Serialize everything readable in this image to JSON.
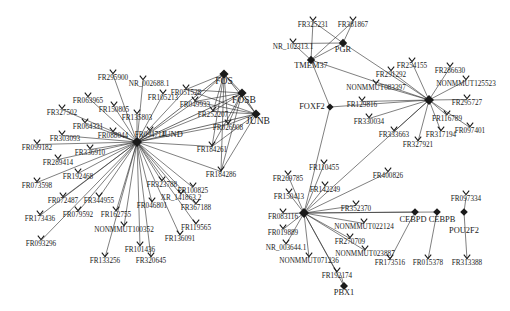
{
  "figure": {
    "type": "network-graph",
    "background": "#ffffff",
    "node_color": "#1a1a1a",
    "edge_color": "#2a2a2a",
    "hub_node_shape": "diamond",
    "leaf_node_shape": "arrowhead-v"
  },
  "hubs": [
    {
      "id": "FOS",
      "label": "FOS",
      "x": 224,
      "y": 74,
      "r": 4.6,
      "lx": 224,
      "ly": 76,
      "size": "hub"
    },
    {
      "id": "FOSB",
      "label": "FOSB",
      "x": 242,
      "y": 93,
      "r": 4.6,
      "lx": 244,
      "ly": 95,
      "size": "hub"
    },
    {
      "id": "JUNB",
      "label": "JUNB",
      "x": 256,
      "y": 114,
      "r": 4.6,
      "lx": 258,
      "ly": 116,
      "size": "hub"
    },
    {
      "id": "JUND",
      "label": "JUND",
      "x": 137,
      "y": 142,
      "r": 5.0,
      "lx": 172,
      "ly": 131,
      "size": "mid"
    },
    {
      "id": "PGR",
      "label": "PGR",
      "x": 343,
      "y": 43,
      "r": 4.2,
      "lx": 343,
      "ly": 46,
      "size": "mid"
    },
    {
      "id": "TMEM37",
      "label": "TMEM37",
      "x": 311,
      "y": 60,
      "r": 4.2,
      "lx": 311,
      "ly": 62,
      "size": "mid"
    },
    {
      "id": "FOXF2",
      "label": "FOXF2",
      "x": 330,
      "y": 107,
      "r": 3.6,
      "lx": 312,
      "ly": 103,
      "size": "mid"
    },
    {
      "id": "HUB_RIGHT",
      "label": "",
      "x": 429,
      "y": 100,
      "r": 5.0,
      "lx": 429,
      "ly": 103,
      "size": "mid"
    },
    {
      "id": "ONE",
      "label": "",
      "x": 304,
      "y": 213,
      "r": 5.0,
      "lx": 304,
      "ly": 216,
      "size": "mid"
    },
    {
      "id": "CEBPD",
      "label": "CEBPD",
      "x": 415,
      "y": 212,
      "r": 3.8,
      "lx": 413,
      "ly": 216,
      "size": "mid"
    },
    {
      "id": "CEBPB",
      "label": "CEBPB",
      "x": 437,
      "y": 212,
      "r": 3.8,
      "lx": 442,
      "ly": 216,
      "size": "mid"
    },
    {
      "id": "POU2F2",
      "label": "POU2F2",
      "x": 464,
      "y": 212,
      "r": 3.8,
      "lx": 464,
      "ly": 227,
      "size": "mid"
    },
    {
      "id": "PBX1",
      "label": "PBX1",
      "x": 344,
      "y": 286,
      "r": 4.0,
      "lx": 344,
      "ly": 289,
      "size": "mid"
    }
  ],
  "leaves": {
    "jund_fan": [
      {
        "label": "FR295900",
        "x": 113,
        "y": 73,
        "tx": 113,
        "ty": 75
      },
      {
        "label": "NR_002688.1",
        "x": 143,
        "y": 79,
        "tx": 149,
        "ty": 81
      },
      {
        "label": "FR063965",
        "x": 88,
        "y": 96,
        "tx": 88,
        "ty": 98
      },
      {
        "label": "FR150805",
        "x": 114,
        "y": 105,
        "tx": 114,
        "ty": 107
      },
      {
        "label": "FR105213",
        "x": 163,
        "y": 93,
        "tx": 163,
        "ty": 95
      },
      {
        "label": "FR135803",
        "x": 137,
        "y": 113,
        "tx": 137,
        "ty": 115
      },
      {
        "label": "FR327502",
        "x": 62,
        "y": 108,
        "tx": 62,
        "ty": 110
      },
      {
        "label": "FR064331",
        "x": 85,
        "y": 122,
        "tx": 88,
        "ty": 124
      },
      {
        "label": "FR303093",
        "x": 62,
        "y": 134,
        "tx": 65,
        "ty": 136
      },
      {
        "label": "FR088044",
        "x": 113,
        "y": 131,
        "tx": 113,
        "ty": 133
      },
      {
        "label": "FR094714",
        "x": 150,
        "y": 130,
        "tx": 150,
        "ty": 132
      },
      {
        "label": "FR099182",
        "x": 37,
        "y": 143,
        "tx": 37,
        "ty": 145
      },
      {
        "label": "FR336910",
        "x": 90,
        "y": 148,
        "tx": 90,
        "ty": 150
      },
      {
        "label": "FR289414",
        "x": 58,
        "y": 158,
        "tx": 58,
        "ty": 160
      },
      {
        "label": "FR192468",
        "x": 78,
        "y": 172,
        "tx": 78,
        "ty": 174
      },
      {
        "label": "FR073598",
        "x": 37,
        "y": 181,
        "tx": 37,
        "ty": 183
      },
      {
        "label": "FR072487",
        "x": 63,
        "y": 196,
        "tx": 63,
        "ty": 198
      },
      {
        "label": "FR344955",
        "x": 99,
        "y": 196,
        "tx": 99,
        "ty": 198
      },
      {
        "label": "FR173436",
        "x": 40,
        "y": 214,
        "tx": 40,
        "ty": 216
      },
      {
        "label": "FR079592",
        "x": 78,
        "y": 210,
        "tx": 78,
        "ty": 212
      },
      {
        "label": "FR162755",
        "x": 116,
        "y": 210,
        "tx": 116,
        "ty": 212
      },
      {
        "label": "FR046801",
        "x": 152,
        "y": 201,
        "tx": 152,
        "ty": 203
      },
      {
        "label": "NONMMUT100352",
        "x": 124,
        "y": 225,
        "tx": 124,
        "ty": 227
      },
      {
        "label": "FR093296",
        "x": 41,
        "y": 239,
        "tx": 41,
        "ty": 241
      },
      {
        "label": "FR101436",
        "x": 140,
        "y": 245,
        "tx": 140,
        "ty": 247
      },
      {
        "label": "FR133256",
        "x": 105,
        "y": 256,
        "tx": 105,
        "ty": 258
      },
      {
        "label": "FR320645",
        "x": 151,
        "y": 256,
        "tx": 151,
        "ty": 258
      },
      {
        "label": "FR136091",
        "x": 180,
        "y": 234,
        "tx": 180,
        "ty": 236
      },
      {
        "label": "FR119565",
        "x": 196,
        "y": 223,
        "tx": 196,
        "ty": 225
      },
      {
        "label": "XR_141863.2",
        "x": 181,
        "y": 193,
        "tx": 181,
        "ty": 195
      },
      {
        "label": "FR367188",
        "x": 196,
        "y": 203,
        "tx": 196,
        "ty": 205
      },
      {
        "label": "FR323788",
        "x": 162,
        "y": 180,
        "tx": 162,
        "ty": 182
      },
      {
        "label": "FR100825",
        "x": 193,
        "y": 186,
        "tx": 193,
        "ty": 188
      },
      {
        "label": "FR184261",
        "x": 212,
        "y": 145,
        "tx": 212,
        "ty": 147
      },
      {
        "label": "FR026908",
        "x": 228,
        "y": 123,
        "tx": 228,
        "ty": 125
      },
      {
        "label": "FR252207",
        "x": 213,
        "y": 110,
        "tx": 213,
        "ty": 112
      },
      {
        "label": "FR049933",
        "x": 195,
        "y": 100,
        "tx": 195,
        "ty": 102
      },
      {
        "label": "FR051528",
        "x": 186,
        "y": 88,
        "tx": 186,
        "ty": 90
      },
      {
        "label": "FR184286",
        "x": 221,
        "y": 170,
        "tx": 221,
        "ty": 172
      }
    ],
    "pgr_group": [
      {
        "label": "FR325231",
        "x": 313,
        "y": 20,
        "tx": 313,
        "ty": 22
      },
      {
        "label": "FR381867",
        "x": 353,
        "y": 20,
        "tx": 353,
        "ty": 22
      },
      {
        "label": "NR_102313.1",
        "x": 293,
        "y": 42,
        "tx": 293,
        "ty": 44
      }
    ],
    "right_hub_fan": [
      {
        "label": "FR254155",
        "x": 412,
        "y": 61,
        "tx": 412,
        "ty": 63
      },
      {
        "label": "FR286630",
        "x": 450,
        "y": 66,
        "tx": 450,
        "ty": 68
      },
      {
        "label": "FR291292",
        "x": 391,
        "y": 70,
        "tx": 391,
        "ty": 72
      },
      {
        "label": "NONMMUT125523",
        "x": 466,
        "y": 79,
        "tx": 466,
        "ty": 81
      },
      {
        "label": "NONMMUT083397",
        "x": 376,
        "y": 83,
        "tx": 376,
        "ty": 85
      },
      {
        "label": "FR129816",
        "x": 362,
        "y": 100,
        "tx": 362,
        "ty": 102
      },
      {
        "label": "FR295727",
        "x": 467,
        "y": 98,
        "tx": 467,
        "ty": 100
      },
      {
        "label": "FR116789",
        "x": 447,
        "y": 114,
        "tx": 447,
        "ty": 116
      },
      {
        "label": "FR097401",
        "x": 470,
        "y": 126,
        "tx": 470,
        "ty": 128
      },
      {
        "label": "FR317194",
        "x": 441,
        "y": 130,
        "tx": 441,
        "ty": 132
      },
      {
        "label": "FR333663",
        "x": 394,
        "y": 130,
        "tx": 394,
        "ty": 132
      },
      {
        "label": "FR327921",
        "x": 418,
        "y": 140,
        "tx": 418,
        "ty": 142
      },
      {
        "label": "FR330034",
        "x": 369,
        "y": 117,
        "tx": 369,
        "ty": 119
      }
    ],
    "one_fan": [
      {
        "label": "FR110455",
        "x": 324,
        "y": 163,
        "tx": 324,
        "ty": 165
      },
      {
        "label": "FR269785",
        "x": 288,
        "y": 174,
        "tx": 288,
        "ty": 176
      },
      {
        "label": "FR142249",
        "x": 325,
        "y": 185,
        "tx": 325,
        "ty": 187
      },
      {
        "label": "FR400826",
        "x": 388,
        "y": 171,
        "tx": 388,
        "ty": 173
      },
      {
        "label": "FR150413",
        "x": 289,
        "y": 192,
        "tx": 289,
        "ty": 194
      },
      {
        "label": "FR352370",
        "x": 356,
        "y": 204,
        "tx": 356,
        "ty": 206
      },
      {
        "label": "FR083116",
        "x": 283,
        "y": 212,
        "tx": 283,
        "ty": 214
      },
      {
        "label": "NONMMUT022124",
        "x": 364,
        "y": 222,
        "tx": 364,
        "ty": 224
      },
      {
        "label": "FR019889",
        "x": 283,
        "y": 228,
        "tx": 283,
        "ty": 230
      },
      {
        "label": "FR270709",
        "x": 350,
        "y": 237,
        "tx": 350,
        "ty": 239
      },
      {
        "label": "NR_003644.1",
        "x": 286,
        "y": 243,
        "tx": 286,
        "ty": 245
      },
      {
        "label": "NONMMUT071236",
        "x": 309,
        "y": 256,
        "tx": 309,
        "ty": 258
      },
      {
        "label": "NONMMUT023887",
        "x": 365,
        "y": 249,
        "tx": 365,
        "ty": 251
      },
      {
        "label": "FR192174",
        "x": 337,
        "y": 271,
        "tx": 337,
        "ty": 273
      }
    ],
    "bottom_right": [
      {
        "label": "FR173516",
        "x": 390,
        "y": 258,
        "tx": 390,
        "ty": 260
      },
      {
        "label": "FR015378",
        "x": 428,
        "y": 258,
        "tx": 428,
        "ty": 260
      },
      {
        "label": "FR313388",
        "x": 467,
        "y": 258,
        "tx": 467,
        "ty": 260
      },
      {
        "label": "FR097334",
        "x": 466,
        "y": 194,
        "tx": 466,
        "ty": 196
      }
    ]
  },
  "edges": {
    "jund_hub": "JUND",
    "one_hub": "ONE",
    "right_hub": "HUB_RIGHT",
    "ap1_clique": [
      [
        "FOS",
        "FOSB"
      ],
      [
        "FOS",
        "JUNB"
      ],
      [
        "FOSB",
        "JUNB"
      ],
      [
        "FOS",
        "JUND"
      ],
      [
        "FOSB",
        "JUND"
      ],
      [
        "JUNB",
        "JUND"
      ]
    ]
  }
}
